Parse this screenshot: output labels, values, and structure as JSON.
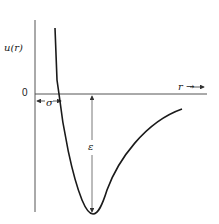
{
  "diagram": {
    "y_axis_label": "u(r)",
    "x_axis_label": "r →",
    "origin_label": "0",
    "sigma_label": "σ",
    "epsilon_label": "ε",
    "colors": {
      "curve": "#1a1a1a",
      "axes": "#555555",
      "background": "#ffffff"
    }
  }
}
